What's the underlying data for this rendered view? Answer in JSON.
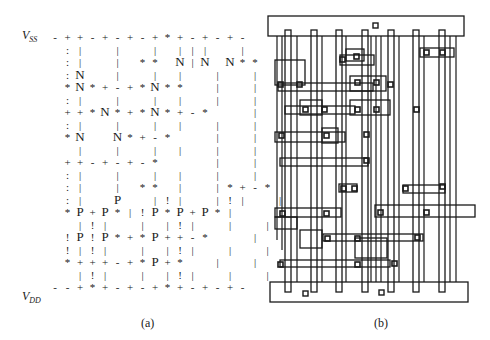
{
  "figure": {
    "panel_a": {
      "caption": "(a)",
      "rail_top": {
        "main": "V",
        "sub": "SS"
      },
      "rail_bottom": {
        "main": "V",
        "sub": "DD"
      },
      "grid_origin": {
        "x": 55,
        "y": 31
      },
      "col_step": 12.5,
      "row_step": 12.5,
      "rows": [
        "-++-+-+-+*+-+-+-",
        " :|  |  | |||  | ",
        " :|  | ** N|N N**",
        " :N  |  | |  |  |",
        " *N*+-+*N**  |  |",
        " :|  |  | |  |  |",
        " ++*N*+*N*+-*   |",
        " :|  |  | |  |  |",
        " *N  N*+-*   |  |",
        "  |  |  | |  |  |",
        " ++-+-+-*    |  |",
        " :|  |  | |  |  |",
        " :|  | ** |  |*+-*",
        " :|  P  |!|  |!|  |",
        " *P+P*|!P*P+P*|",
        "  |!|  | |!|  |  |",
        " !P!P*+*P++-*   |",
        " !|!|  | |!|  |  |",
        " *+++-+*P+*  |  |",
        "  |!|  | |!|  |  |",
        "--+*+-+-+*+-+-+-"
      ]
    },
    "panel_b": {
      "caption": "(b)"
    }
  }
}
